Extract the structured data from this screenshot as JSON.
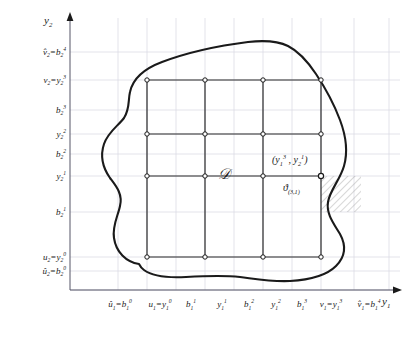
{
  "figure": {
    "background_color": "#ffffff",
    "grid_color": "#d9d9e2",
    "curve_color": "#1a1a1a",
    "mesh_color": "#2b2b2b",
    "hatch_color": "#8a8a8a",
    "text_color": "#1a1a1a"
  },
  "axes": {
    "x_axis_name": "y₁",
    "y_axis_name": "y₂",
    "x_axis_name_html": "y<sub>1</sub>",
    "y_axis_name_html": "y<sub>2</sub>"
  },
  "x_ticks": [
    {
      "label": "û₁=b₁⁰",
      "html": "<i>û</i><sub>1</sub>=<i>b</i><sub>1</sub><sup>0</sup>",
      "px": 118,
      "is_node_column": false
    },
    {
      "label": "u₁=y₁⁰",
      "html": "<i>u</i><sub>1</sub>=<i>y</i><sub>1</sub><sup>0</sup>",
      "px": 147,
      "is_node_column": true
    },
    {
      "label": "b₁¹",
      "html": "<i>b</i><sub>1</sub><sup>1</sup>",
      "px": 176,
      "is_node_column": false
    },
    {
      "label": "y₁¹",
      "html": "<i>y</i><sub>1</sub><sup>1</sup>",
      "px": 205,
      "is_node_column": true
    },
    {
      "label": "b₁²",
      "html": "<i>b</i><sub>1</sub><sup>2</sup>",
      "px": 234,
      "is_node_column": false
    },
    {
      "label": "y₁²",
      "html": "<i>y</i><sub>1</sub><sup>2</sup>",
      "px": 263,
      "is_node_column": true
    },
    {
      "label": "b₁³",
      "html": "<i>b</i><sub>1</sub><sup>3</sup>",
      "px": 292,
      "is_node_column": false
    },
    {
      "label": "v₁=y₁³",
      "html": "<i>v</i><sub>1</sub>=<i>y</i><sub>1</sub><sup>3</sup>",
      "px": 321,
      "is_node_column": true
    },
    {
      "label": "v̂₁=b₁⁴",
      "html": "<i>v̂</i><sub>1</sub>=<i>b</i><sub>1</sub><sup>4</sup>",
      "px": 354,
      "is_node_column": false
    }
  ],
  "y_ticks": [
    {
      "label": "v̂₂=b₂⁴",
      "html": "<i>v̂</i><sub>2</sub>=<i>b</i><sub>2</sub><sup>4</sup>",
      "px": 52,
      "is_node_row": false
    },
    {
      "label": "v₂=y₂³",
      "html": "<i>v</i><sub>2</sub>=<i>y</i><sub>2</sub><sup>3</sup>",
      "px": 80,
      "is_node_row": true
    },
    {
      "label": "b₂³",
      "html": "<i>b</i><sub>2</sub><sup>3</sup>",
      "px": 110,
      "is_node_row": false
    },
    {
      "label": "y₂²",
      "html": "<i>y</i><sub>2</sub><sup>2</sup>",
      "px": 134,
      "is_node_row": true
    },
    {
      "label": "b₂²",
      "html": "<i>b</i><sub>2</sub><sup>2</sup>",
      "px": 154,
      "is_node_row": false
    },
    {
      "label": "y₂¹",
      "html": "<i>y</i><sub>2</sub><sup>1</sup>",
      "px": 176,
      "is_node_row": true
    },
    {
      "label": "b₂¹",
      "html": "<i>b</i><sub>2</sub><sup>1</sup>",
      "px": 212,
      "is_node_row": false
    },
    {
      "label": "u₂=y₂⁰",
      "html": "<i>u</i><sub>2</sub>=<i>y</i><sub>2</sub><sup>0</sup>",
      "px": 257,
      "is_node_row": true
    },
    {
      "label": "û₂=b₂⁰",
      "html": "<i>û</i><sub>2</sub>=<i>b</i><sub>2</sub><sup>0</sup>",
      "px": 271,
      "is_node_row": false
    }
  ],
  "annotations": {
    "domain_label": "𝒟",
    "domain_label_html": "<i>𝒟</i>",
    "point_label": "(y₁³ , y₂¹)",
    "point_label_html": "(<i>y</i><sub>1</sub><sup>3</sup> , <i>y</i><sub>2</sub><sup>1</sup>)",
    "cell_label": "ϑ₍₃,₁₎",
    "cell_label_html": "<i>ϑ</i><sub>(3,1)</sub>"
  },
  "chart_data": {
    "type": "scatter",
    "title": "",
    "xlabel": "y₁",
    "ylabel": "y₂",
    "grid": true,
    "legend": "none",
    "node_columns_px": [
      147,
      205,
      263,
      321
    ],
    "node_rows_px": [
      80,
      134,
      176,
      257
    ],
    "node_count": 16,
    "highlighted_node": {
      "x_label": "y₁³",
      "y_label": "y₂¹",
      "x_px": 321,
      "y_px": 176
    },
    "hatched_cell": {
      "x0_px": 321,
      "y0_px": 176,
      "x1_px": 354,
      "y1_px": 212
    }
  }
}
